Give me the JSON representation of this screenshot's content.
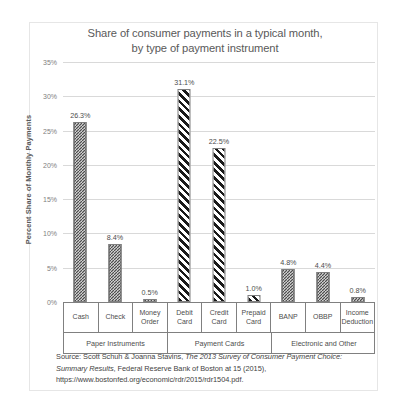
{
  "chart_data": {
    "type": "bar",
    "title": "Share of consumer payments in a typical month, by type of payment instrument",
    "title_line1": "Share of consumer payments in a typical month,",
    "title_line2": "by type of payment instrument",
    "xlabel": "",
    "ylabel": "Percent Share of Monthly Payments",
    "ylim": [
      0,
      35
    ],
    "ytick_labels": [
      "0%",
      "5%",
      "10%",
      "15%",
      "20%",
      "25%",
      "30%",
      "35%"
    ],
    "ytick_values": [
      0,
      5,
      10,
      15,
      20,
      25,
      30,
      35
    ],
    "grid": true,
    "legend": "none",
    "categories": [
      "Cash",
      "Check",
      "Money Order",
      "Debit Card",
      "Credit Card",
      "Prepaid Card",
      "BANP",
      "OBBP",
      "Income Deduction"
    ],
    "values": [
      26.3,
      8.4,
      0.5,
      31.1,
      22.5,
      1.0,
      4.8,
      4.4,
      0.8
    ],
    "data_labels": [
      "26.3%",
      "8.4%",
      "0.5%",
      "31.1%",
      "22.5%",
      "1.0%",
      "4.8%",
      "4.4%",
      "0.8%"
    ],
    "bar_patterns": [
      "dots",
      "dots",
      "dots",
      "stripes",
      "stripes",
      "stripes",
      "dots",
      "dots",
      "dots"
    ],
    "groups": [
      {
        "label": "Paper Instruments",
        "span": 3
      },
      {
        "label": "Payment Cards",
        "span": 3
      },
      {
        "label": "Electronic and Other",
        "span": 3
      }
    ],
    "colors": {
      "bar_outline": "#7f7f7f",
      "bar_fill_dark": "#4d4d4d",
      "gridline": "#d9d9d9",
      "axis_line": "#808080",
      "title_text": "#595959",
      "tick_text": "#808080",
      "label_text": "#4d4d4d"
    }
  },
  "categories_multiline": [
    [
      "Cash"
    ],
    [
      "Check"
    ],
    [
      "Money",
      "Order"
    ],
    [
      "Debit",
      "Card"
    ],
    [
      "Credit",
      "Card"
    ],
    [
      "Prepaid",
      "Card"
    ],
    [
      "BANP"
    ],
    [
      "OBBP"
    ],
    [
      "Income",
      "Deduction"
    ]
  ],
  "source": {
    "prefix": "Source: Scott Schuh & Joanna Stavins, ",
    "italic_title": "The 2013 Survey of Consumer Payment Choice: Summary Results",
    "suffix": ", Federal Reserve Bank of Boston at 15 (2015), https://www.bostonfed.org/economic/rdr/2015/rdr1504.pdf."
  }
}
